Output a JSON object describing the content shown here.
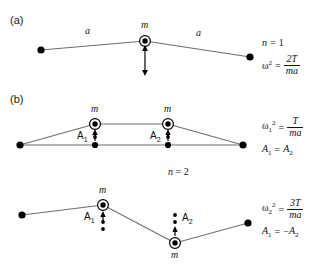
{
  "figure": {
    "width": 318,
    "height": 268,
    "background": "#ffffff",
    "line_color": "#6e6e6e",
    "node_color": "#000000"
  },
  "panels": [
    {
      "id": "a",
      "label": "(a)",
      "mode_label": "n = 1",
      "segment_labels": [
        "a",
        "a"
      ],
      "mass_labels": [
        "m"
      ],
      "equations": {
        "frequency": {
          "symbol": "ω",
          "exponent": "2",
          "numerator": "2T",
          "denominator": "ma"
        }
      }
    },
    {
      "id": "b",
      "label": "(b)",
      "mode_label": "n = 2",
      "sub_panels": [
        {
          "id": "b1",
          "mass_labels": [
            "m",
            "m"
          ],
          "amplitude_labels": [
            "A1",
            "A2"
          ],
          "equations": {
            "frequency": {
              "symbol": "ω",
              "subscript": "1",
              "exponent": "2",
              "numerator": "T",
              "denominator": "ma"
            },
            "relation": "A1 = A2"
          }
        },
        {
          "id": "b2",
          "mass_labels": [
            "m",
            "m"
          ],
          "amplitude_labels": [
            "A1",
            "A2"
          ],
          "equations": {
            "frequency": {
              "symbol": "ω",
              "subscript": "2",
              "exponent": "2",
              "numerator": "3T",
              "denominator": "ma"
            },
            "relation": "A1 = −A2"
          }
        }
      ]
    }
  ],
  "labels": {
    "panel_a": "(a)",
    "panel_b": "(b)",
    "n_equals_1": "n = 1",
    "n_equals_2": "n = 2",
    "m": "m",
    "a": "a",
    "A1": "A",
    "A2": "A",
    "sub1": "1",
    "sub2": "2",
    "omega": "ω",
    "exp2": "2",
    "num_2T": "2T",
    "num_T": "T",
    "num_3T": "3T",
    "den_ma": "ma",
    "eq": "=",
    "A1_eq_A2_left": "A",
    "A1_eq_A2_right": "A",
    "minus": "−"
  }
}
